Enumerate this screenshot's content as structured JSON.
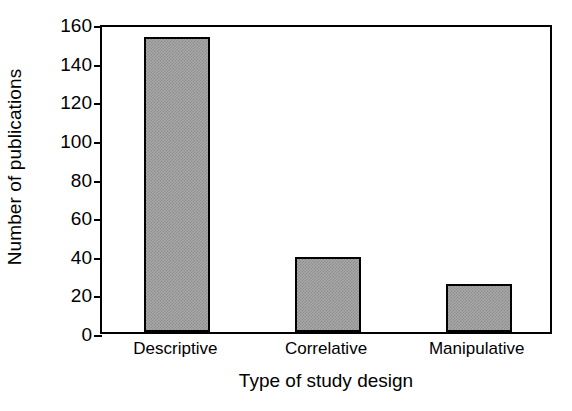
{
  "chart_data": {
    "type": "bar",
    "title": "",
    "subtitle": "",
    "categories": [
      "Descriptive",
      "Correlative",
      "Manipulative"
    ],
    "values": [
      153,
      39,
      25
    ],
    "xlabel": "Type of study design",
    "ylabel": "Number of publications",
    "ylim": [
      0,
      160
    ],
    "yticks": [
      0,
      20,
      40,
      60,
      80,
      100,
      120,
      140,
      160
    ],
    "ytick_labels": [
      "0",
      "20",
      "40",
      "60",
      "80",
      "100",
      "120",
      "140",
      "160"
    ],
    "grid": false,
    "legend": null,
    "legend_position": "none",
    "annotations": [],
    "bar_fill_color": "#a8a8a8",
    "bar_edge_color": "#000000",
    "axis_color": "#000000",
    "background_color": "#ffffff",
    "frame": "full-box",
    "tick_direction": "out"
  }
}
